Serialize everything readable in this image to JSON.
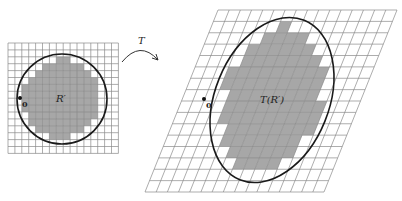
{
  "diagram": {
    "left_panel": {
      "region_label": "R′",
      "origin_label": "0",
      "grid": {
        "x": 8,
        "y": 43,
        "cols": 16,
        "rows": 16,
        "cell": 6.9
      },
      "circle": {
        "cx": 62,
        "cy": 99,
        "r": 45
      },
      "origin_point": {
        "x": 20,
        "y": 98
      }
    },
    "transform": {
      "label": "T"
    },
    "right_panel": {
      "region_label": "T(R′)",
      "origin_label": "0",
      "grid": {
        "tl": [
          218,
          10
        ],
        "tr": [
          397,
          10
        ],
        "bl": [
          145,
          192
        ],
        "cols": 16,
        "rows": 16
      },
      "ellipse": {
        "cx": 272,
        "cy": 100,
        "rx": 57,
        "ry": 86,
        "rotate": 22
      },
      "origin_point": {
        "x": 204,
        "y": 99
      }
    },
    "colors": {
      "shade": "#a7a7a7",
      "grid": "#8a8a8a",
      "curve": "#1a1a1a"
    }
  }
}
